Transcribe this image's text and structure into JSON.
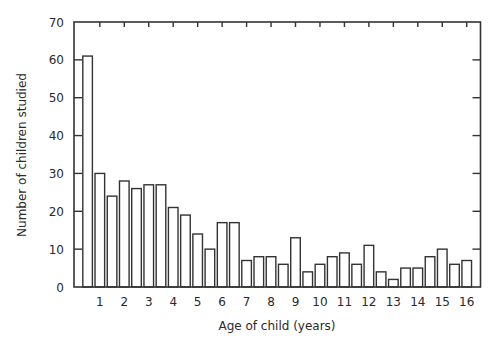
{
  "chart_data": {
    "type": "bar",
    "title": "",
    "xlabel": "Age of child (years)",
    "ylabel": "Number of children studied",
    "ylim": [
      0,
      70
    ],
    "yticks": [
      0,
      10,
      20,
      30,
      40,
      50,
      60,
      70
    ],
    "xtick_labels": [
      "1",
      "2",
      "3",
      "4",
      "5",
      "6",
      "7",
      "8",
      "9",
      "10",
      "11",
      "12",
      "13",
      "14",
      "15",
      "16"
    ],
    "grid": false,
    "legend": null,
    "bar_style": {
      "fill": "#ffffff",
      "stroke": "#333333"
    },
    "categories": [
      "<1",
      "1",
      "1.5",
      "2",
      "2.5",
      "3",
      "3.5",
      "4",
      "4.5",
      "5",
      "5.5",
      "6",
      "6.5",
      "7",
      "7.5",
      "8",
      "8.5",
      "9",
      "9.5",
      "10",
      "10.5",
      "11",
      "11.5",
      "12",
      "12.5",
      "13",
      "13.5",
      "14",
      "14.5",
      "15",
      "15.5",
      "16"
    ],
    "values": [
      61,
      30,
      24,
      28,
      26,
      27,
      27,
      21,
      19,
      14,
      10,
      17,
      17,
      7,
      8,
      8,
      6,
      13,
      4,
      6,
      8,
      9,
      6,
      11,
      4,
      2,
      5,
      5,
      8,
      10,
      6,
      7
    ]
  }
}
